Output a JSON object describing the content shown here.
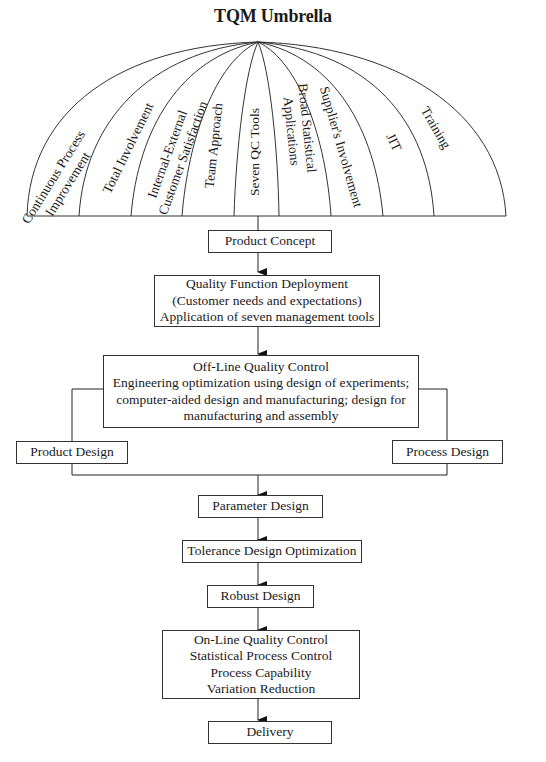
{
  "title": "TQM Umbrella",
  "umbrella": {
    "segments": [
      {
        "lines": [
          "Continuous Process",
          "Improvement"
        ]
      },
      {
        "lines": [
          "Total Involvement"
        ]
      },
      {
        "lines": [
          "Internal-External",
          "Customer Satisfaction"
        ]
      },
      {
        "lines": [
          "Team Approach"
        ]
      },
      {
        "lines": [
          "Seven QC Tools"
        ]
      },
      {
        "lines": [
          "Broad Statistical",
          "Applications"
        ]
      },
      {
        "lines": [
          "Supplier's Involvement"
        ]
      },
      {
        "lines": [
          "JIT"
        ]
      },
      {
        "lines": [
          "Training"
        ]
      }
    ]
  },
  "flow": {
    "product_concept": "Product Concept",
    "qfd": {
      "line1": "Quality Function Deployment",
      "line2": "(Customer needs and expectations)",
      "line3": "Application of seven management tools"
    },
    "offline": {
      "line1": "Off-Line Quality Control",
      "line2": "Engineering optimization using design of experiments;",
      "line3": "computer-aided design and manufacturing; design for",
      "line4": "manufacturing and assembly"
    },
    "product_design": "Product Design",
    "process_design": "Process Design",
    "parameter_design": "Parameter Design",
    "tolerance_design": "Tolerance Design Optimization",
    "robust_design": "Robust Design",
    "online": {
      "line1": "On-Line Quality Control",
      "line2": "Statistical Process Control",
      "line3": "Process Capability",
      "line4": "Variation Reduction"
    },
    "delivery": "Delivery"
  }
}
